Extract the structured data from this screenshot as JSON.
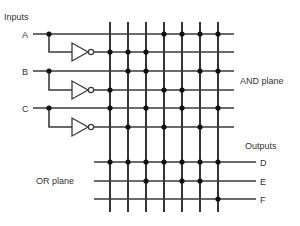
{
  "labels": {
    "inputs": "Inputs",
    "and_plane": "AND plane",
    "or_plane": "OR plane",
    "outputs": "Outputs"
  },
  "inputs": [
    {
      "name": "A",
      "y": 34,
      "inv_y": 52
    },
    {
      "name": "B",
      "y": 71,
      "inv_y": 90
    },
    {
      "name": "C",
      "y": 108,
      "inv_y": 127
    }
  ],
  "outputs": [
    {
      "name": "D",
      "y": 162
    },
    {
      "name": "E",
      "y": 181
    },
    {
      "name": "F",
      "y": 199
    }
  ],
  "columns_x": [
    110,
    128,
    146,
    164,
    182,
    200,
    218
  ],
  "and_plane_connections": {
    "A": [
      4,
      5,
      6,
      7
    ],
    "A_bar": [
      1,
      2,
      3
    ],
    "B": [
      2,
      3,
      6,
      7
    ],
    "B_bar": [
      1,
      4,
      5
    ],
    "C": [
      1,
      3,
      5,
      7
    ],
    "C_bar": [
      2,
      4,
      6
    ]
  },
  "or_plane_connections": {
    "D": [
      1,
      2,
      3,
      4,
      5,
      6,
      7
    ],
    "E": [
      3,
      5,
      6
    ],
    "F": [
      7
    ]
  },
  "colors": {
    "line": "#3a3a3a",
    "dot": "#111111",
    "text": "#333333"
  }
}
